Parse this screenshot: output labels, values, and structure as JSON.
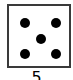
{
  "die": {
    "face_value": 5,
    "pips": [
      {
        "x": 11,
        "y": 12
      },
      {
        "x": 42,
        "y": 12
      },
      {
        "x": 27,
        "y": 28
      },
      {
        "x": 11,
        "y": 43
      },
      {
        "x": 42,
        "y": 43
      }
    ],
    "border_color": "#3a3a3a",
    "pip_color": "#000000"
  },
  "label": {
    "text": "5"
  }
}
